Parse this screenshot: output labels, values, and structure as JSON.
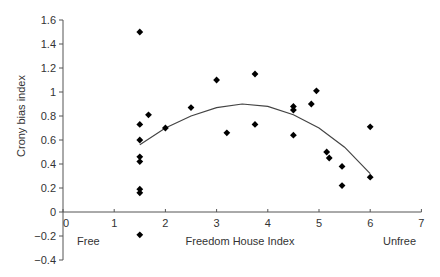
{
  "chart_data": {
    "type": "scatter",
    "title": "",
    "xlabel": "Freedom House Index",
    "ylabel": "Crony bias index",
    "xlim": [
      0,
      7
    ],
    "ylim": [
      -0.4,
      1.6
    ],
    "xticks": [
      0,
      1,
      2,
      3,
      4,
      5,
      6,
      7
    ],
    "yticks": [
      -0.4,
      -0.2,
      0,
      0.2,
      0.4,
      0.6,
      0.8,
      1,
      1.2,
      1.4,
      1.6
    ],
    "ytick_labels": [
      "−0.4",
      "−0.2",
      "0",
      "0.2",
      "0.4",
      "0.6",
      "0.8",
      "1",
      "1.2",
      "1.4",
      "1.6"
    ],
    "grid": false,
    "legend": null,
    "annotations": [
      {
        "text": "Free",
        "x": 0.5,
        "y": -0.2
      },
      {
        "text": "Unfree",
        "x": 6.5,
        "y": -0.2
      }
    ],
    "points": [
      {
        "x": 1.5,
        "y": 1.5
      },
      {
        "x": 1.5,
        "y": 0.73
      },
      {
        "x": 1.5,
        "y": 0.6
      },
      {
        "x": 1.5,
        "y": 0.46
      },
      {
        "x": 1.5,
        "y": 0.42
      },
      {
        "x": 1.5,
        "y": 0.19
      },
      {
        "x": 1.5,
        "y": 0.16
      },
      {
        "x": 1.5,
        "y": -0.19
      },
      {
        "x": 1.67,
        "y": 0.81
      },
      {
        "x": 2.0,
        "y": 0.7
      },
      {
        "x": 2.5,
        "y": 0.87
      },
      {
        "x": 3.0,
        "y": 1.1
      },
      {
        "x": 3.2,
        "y": 0.66
      },
      {
        "x": 3.75,
        "y": 1.15
      },
      {
        "x": 3.75,
        "y": 0.73
      },
      {
        "x": 4.5,
        "y": 0.88
      },
      {
        "x": 4.5,
        "y": 0.85
      },
      {
        "x": 4.5,
        "y": 0.64
      },
      {
        "x": 4.85,
        "y": 0.9
      },
      {
        "x": 4.95,
        "y": 1.01
      },
      {
        "x": 5.15,
        "y": 0.5
      },
      {
        "x": 5.2,
        "y": 0.45
      },
      {
        "x": 5.45,
        "y": 0.38
      },
      {
        "x": 5.45,
        "y": 0.22
      },
      {
        "x": 6.0,
        "y": 0.71
      },
      {
        "x": 6.0,
        "y": 0.29
      }
    ],
    "trendline": {
      "type": "quadratic",
      "x_range": [
        1.5,
        6.0
      ],
      "points": [
        {
          "x": 1.5,
          "y": 0.56
        },
        {
          "x": 2.0,
          "y": 0.7
        },
        {
          "x": 2.5,
          "y": 0.8
        },
        {
          "x": 3.0,
          "y": 0.87
        },
        {
          "x": 3.5,
          "y": 0.9
        },
        {
          "x": 4.0,
          "y": 0.88
        },
        {
          "x": 4.5,
          "y": 0.81
        },
        {
          "x": 5.0,
          "y": 0.7
        },
        {
          "x": 5.5,
          "y": 0.54
        },
        {
          "x": 6.0,
          "y": 0.32
        }
      ]
    }
  }
}
